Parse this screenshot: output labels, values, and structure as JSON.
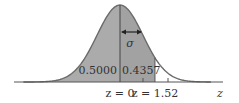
{
  "figure": {
    "left_area_label": "0.5000",
    "right_area_label": "0.4357",
    "sigma_label": "σ",
    "z0_label": "z = 0",
    "z152_label": "z = 1.52",
    "axis_label": "z"
  },
  "colors": {
    "left_fill": "#ababab",
    "right_fill": "#a2a2a2",
    "curve": "#6a6a6a",
    "axis": "#555555",
    "text": "#333333"
  },
  "chart_data": {
    "type": "area",
    "xlabel": "z",
    "ylabel": "",
    "distribution": "standard normal",
    "mean": 0,
    "sd": 1,
    "shaded_regions": [
      {
        "from": "-inf",
        "to": 0,
        "area": 0.5,
        "label": "0.5000"
      },
      {
        "from": 0,
        "to": 1.52,
        "area": 0.4357,
        "label": "0.4357"
      }
    ],
    "annotations": [
      "σ",
      "z = 0",
      "z = 1.52"
    ],
    "ticks": [
      1,
      2
    ],
    "grid": false
  }
}
